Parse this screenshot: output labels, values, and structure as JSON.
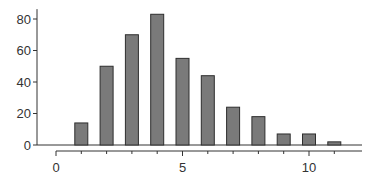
{
  "chart_data": {
    "type": "bar",
    "title": "",
    "xlabel": "",
    "ylabel": "",
    "categories": [
      0,
      1,
      2,
      3,
      4,
      5,
      6,
      7,
      8,
      9,
      10,
      11
    ],
    "values": [
      0,
      14,
      50,
      70,
      83,
      55,
      44,
      24,
      18,
      7,
      7,
      2
    ],
    "xticks_major": [
      0,
      5,
      10
    ],
    "xtick_labels": [
      "0",
      "5",
      "10"
    ],
    "yticks": [
      0,
      20,
      40,
      60,
      80
    ],
    "ytick_labels": [
      "0",
      "20",
      "40",
      "60",
      "80"
    ],
    "ylim": [
      0,
      85
    ],
    "xlim": [
      -0.5,
      12
    ],
    "grid": false,
    "legend": null,
    "colors": {
      "bar_fill": "#7a7a7a",
      "bar_edge": "#2e2e2e",
      "axis": "#333333"
    }
  }
}
